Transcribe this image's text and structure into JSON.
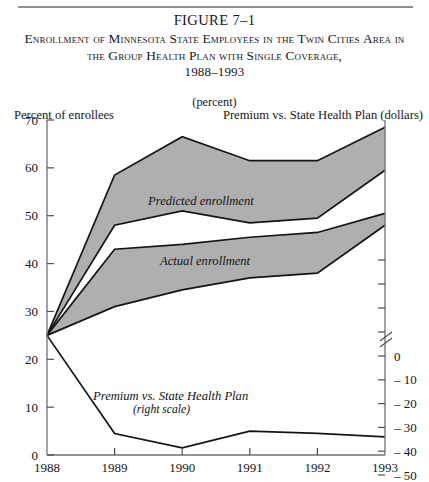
{
  "figure": {
    "number": "FIGURE 7–1",
    "title_line1": "Enrollment of Minnesota State Employees in the Twin Cities",
    "title_line2": "Area in the Group Health Plan with Single Coverage,",
    "title_years": "1988–1993",
    "units": "(percent)"
  },
  "chart_data": {
    "type": "area",
    "title": "Enrollment of Minnesota State Employees in the Twin Cities Area in the Group Health Plan with Single Coverage, 1988–1993",
    "subtitle": "(percent)",
    "xlabel": "",
    "ylabel": "Percent of enrollees",
    "ylabel_right": "Premium vs. State Health Plan (dollars)",
    "categories": [
      "1988",
      "1989",
      "1990",
      "1991",
      "1992",
      "1993"
    ],
    "x": [
      1988,
      1989,
      1990,
      1991,
      1992,
      1993
    ],
    "ylim": [
      0,
      70
    ],
    "yticks": [
      0,
      10,
      20,
      30,
      40,
      50,
      60,
      70
    ],
    "ylim_right": [
      -50,
      0
    ],
    "yticks_right": [
      0,
      -10,
      -20,
      -30,
      -40,
      -50
    ],
    "right_axis_break": true,
    "grid": false,
    "legend": "in-plot annotations",
    "series": [
      {
        "name": "Predicted enrollment (upper bound)",
        "axis": "left",
        "values": [
          25,
          58.5,
          66.5,
          61.5,
          61.5,
          68.5
        ]
      },
      {
        "name": "Predicted enrollment (lower bound)",
        "axis": "left",
        "values": [
          25,
          48,
          51,
          48.5,
          49.5,
          59.5
        ]
      },
      {
        "name": "Actual enrollment (upper bound)",
        "axis": "left",
        "values": [
          25,
          43,
          44,
          45.5,
          46.5,
          50.5
        ]
      },
      {
        "name": "Actual enrollment (lower bound)",
        "axis": "left",
        "values": [
          25,
          31,
          34.5,
          37,
          38,
          48
        ]
      },
      {
        "name": "Premium vs. State Health Plan",
        "axis": "right",
        "values_left_scale": [
          25,
          4.5,
          1.5,
          5,
          4.5,
          3.8
        ],
        "values": [
          0,
          -35,
          -38,
          -34,
          -35,
          -36
        ]
      }
    ],
    "annotations": [
      {
        "text": "Predicted enrollment",
        "x": 1989.6,
        "y": 55
      },
      {
        "text": "Actual enrollment",
        "x": 1990.0,
        "y": 41.5
      },
      {
        "text": "Premium vs. State Health Plan",
        "x": 1989.9,
        "y": 13.5
      },
      {
        "text": "(right scale)",
        "x": 1989.9,
        "y": 10.8
      }
    ]
  },
  "axes": {
    "left_title": "Percent of enrollees",
    "right_title": "Premium vs. State Health Plan (dollars)",
    "left_ticks": [
      "70",
      "60",
      "50",
      "40",
      "30",
      "20",
      "10",
      "0"
    ],
    "right_ticks": [
      "0",
      "– 10",
      "– 20",
      "– 30",
      "– 40",
      "– 50"
    ],
    "x_ticks": [
      "1988",
      "1989",
      "1990",
      "1991",
      "1992",
      "1993"
    ]
  },
  "annotations": {
    "predicted": "Predicted enrollment",
    "actual": "Actual enrollment",
    "premium": "Premium vs. State Health Plan",
    "premium_sub": "(right scale)"
  }
}
